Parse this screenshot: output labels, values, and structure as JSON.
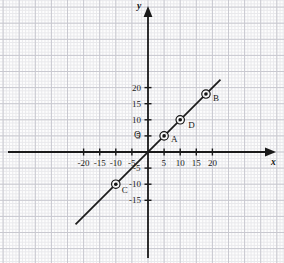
{
  "chart_data": {
    "type": "line",
    "title": "",
    "xlabel": "x",
    "ylabel": "y",
    "origin_label": "O",
    "xlim": [
      -23,
      23
    ],
    "ylim": [
      -17,
      24
    ],
    "grid": true,
    "grid_minor_step": 1,
    "grid_major_step": 5,
    "legend": "none",
    "equation": "y = x",
    "series": [
      {
        "name": "y = x",
        "x": [
          -22.5,
          22.5
        ],
        "y": [
          -22.5,
          22.5
        ]
      }
    ],
    "xticks": [
      -20,
      -15,
      -10,
      -5,
      5,
      10,
      15,
      20
    ],
    "xtick_labels": [
      "-20",
      "-15",
      "-10",
      "-5",
      "5",
      "10",
      "15",
      "20"
    ],
    "yticks": [
      -15,
      -10,
      -5,
      5,
      10,
      15,
      20
    ],
    "ytick_labels": [
      "-15",
      "-10",
      "-5",
      "5",
      "10",
      "15",
      "20"
    ],
    "points": [
      {
        "label": "A",
        "x": 5,
        "y": 5,
        "label_dx": 7,
        "label_dy": 4
      },
      {
        "label": "B",
        "x": 18,
        "y": 18,
        "label_dx": 7,
        "label_dy": 5
      },
      {
        "label": "C",
        "x": -10,
        "y": -10,
        "label_dx": 6,
        "label_dy": 7
      },
      {
        "label": "D",
        "x": 10,
        "y": 10,
        "label_dx": 8,
        "label_dy": 6
      }
    ]
  },
  "style": {
    "line_color": "#1b1b1b",
    "axis_color": "#1a1a1a",
    "grid_minor_color": "#e9e9ec",
    "grid_major_color": "#c9c9d0",
    "point_color": "#111111",
    "background": "#fdfdfd"
  }
}
